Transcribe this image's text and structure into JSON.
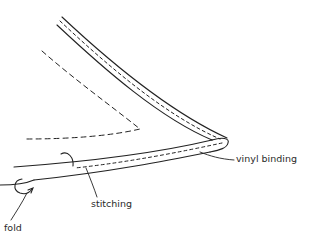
{
  "diagram": {
    "title": "",
    "labels": {
      "vinyl_binding": "vinyl binding",
      "stitching": "stitching",
      "fold": "fold"
    },
    "colors": {
      "background": "#ffffff",
      "line": "#222222"
    },
    "elements": [
      {
        "id": "binding-upper-outer",
        "type": "solid-curve"
      },
      {
        "id": "binding-upper-inner",
        "type": "solid-curve"
      },
      {
        "id": "binding-upper-stitching",
        "type": "dashed-curve"
      },
      {
        "id": "binding-tip",
        "type": "solid-curve"
      },
      {
        "id": "binding-lower-outer",
        "type": "solid-curve"
      },
      {
        "id": "binding-lower-inner",
        "type": "solid-curve"
      },
      {
        "id": "binding-lower-stitching",
        "type": "dashed-curve"
      },
      {
        "id": "hidden-edge",
        "type": "dashed-curve"
      },
      {
        "id": "fabric-lower-edge",
        "type": "solid-line"
      },
      {
        "id": "fold-arrow",
        "type": "arrow"
      },
      {
        "id": "curl-mark",
        "type": "solid-curve"
      }
    ]
  }
}
